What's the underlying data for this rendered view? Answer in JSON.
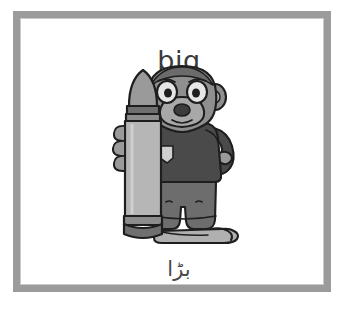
{
  "card": {
    "word_english": "big",
    "word_urdu": "بڑا",
    "frame_color": "#9b9b9b",
    "background_color": "#ffffff",
    "text_color": "#3a3a3a"
  },
  "illustration": {
    "name": "monkey-holding-giant-crayon",
    "description": "A cartoon monkey character standing beside an oversized crayon that is taller than the monkey, illustrating the concept big",
    "parts": [
      "giant-crayon",
      "monkey-character"
    ],
    "colors": {
      "crayon_body": "#b6b6b6",
      "crayon_tip": "#9a9a9a",
      "crayon_band": "#6f6f6f",
      "monkey_skin": "#8f8f8f",
      "monkey_muzzle": "#a8a8a8",
      "shirt": "#4a4a4a",
      "shorts": "#6d6d6d",
      "pocket": "#cfcfcf",
      "outline": "#1e1e1e"
    }
  }
}
